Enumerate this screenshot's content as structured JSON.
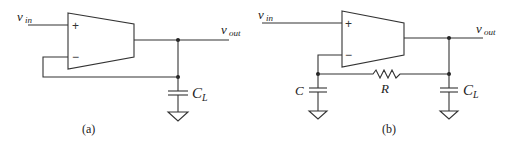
{
  "figure": {
    "panels": [
      {
        "id": "a",
        "caption": "(a)",
        "labels": {
          "vin_main": "v",
          "vin_sub": "in",
          "vout_main": "v",
          "vout_sub": "out",
          "cl_main": "C",
          "cl_sub": "L",
          "plus": "+",
          "minus": "−"
        },
        "description": "Unity-gain buffer op-amp driving load capacitor C_L"
      },
      {
        "id": "b",
        "caption": "(b)",
        "labels": {
          "vin_main": "v",
          "vin_sub": "in",
          "vout_main": "v",
          "vout_sub": "out",
          "cl_main": "C",
          "cl_sub": "L",
          "c_main": "C",
          "r_main": "R",
          "plus": "+",
          "minus": "−"
        },
        "description": "Op-amp with RC feedback network driving load capacitor C_L"
      }
    ],
    "colors": {
      "wire": "#333333",
      "background": "#ffffff"
    }
  }
}
